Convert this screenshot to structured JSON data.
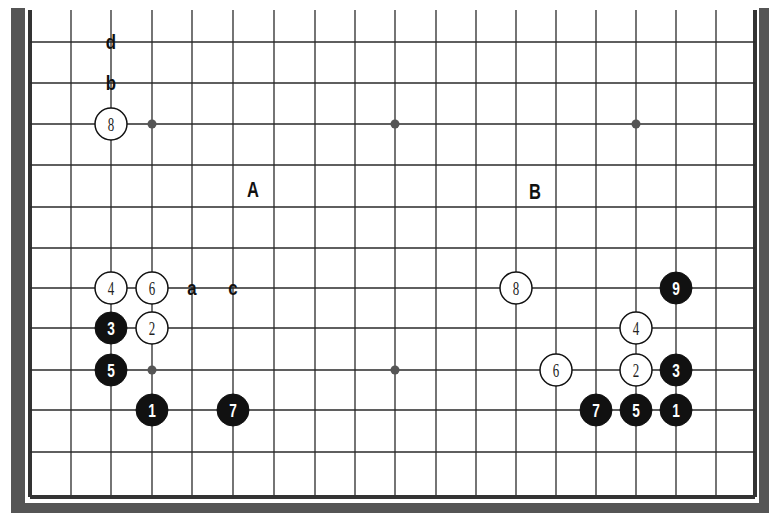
{
  "diagram": {
    "colors": {
      "border_band": "#555555",
      "grid_line": "#2a2a2a",
      "edge_line": "#333333",
      "hoshi": "#555555",
      "black_stone": "#111111",
      "white_stone": "#ffffff",
      "stone_outline": "#111111",
      "background": "#ffffff"
    },
    "grid": {
      "columns_x": [
        30,
        71,
        111,
        152,
        192,
        233,
        274,
        315,
        355,
        395,
        436,
        476,
        516,
        556,
        596,
        636,
        676,
        716,
        755
      ],
      "rows_y": [
        42,
        83,
        124,
        165,
        207,
        248,
        288,
        328,
        370,
        410,
        452,
        497
      ],
      "top_visible_y": 10
    },
    "hoshi": [
      {
        "col": 3,
        "row": 2
      },
      {
        "col": 9,
        "row": 2
      },
      {
        "col": 15,
        "row": 2
      },
      {
        "col": 3,
        "row": 8
      },
      {
        "col": 9,
        "row": 8
      },
      {
        "col": 15,
        "row": 8
      }
    ],
    "stones": [
      {
        "color": "white",
        "label": "8",
        "col": 2,
        "row": 2
      },
      {
        "color": "white",
        "label": "4",
        "col": 2,
        "row": 6
      },
      {
        "color": "white",
        "label": "6",
        "col": 3,
        "row": 6
      },
      {
        "color": "black",
        "label": "3",
        "col": 2,
        "row": 7
      },
      {
        "color": "white",
        "label": "2",
        "col": 3,
        "row": 7
      },
      {
        "color": "black",
        "label": "5",
        "col": 2,
        "row": 8
      },
      {
        "color": "black",
        "label": "1",
        "col": 3,
        "row": 9
      },
      {
        "color": "black",
        "label": "7",
        "col": 5,
        "row": 9
      },
      {
        "color": "white",
        "label": "8",
        "col": 12,
        "row": 6
      },
      {
        "color": "black",
        "label": "9",
        "col": 16,
        "row": 6
      },
      {
        "color": "white",
        "label": "4",
        "col": 15,
        "row": 7
      },
      {
        "color": "white",
        "label": "6",
        "col": 13,
        "row": 8
      },
      {
        "color": "white",
        "label": "2",
        "col": 15,
        "row": 8
      },
      {
        "color": "black",
        "label": "3",
        "col": 16,
        "row": 8
      },
      {
        "color": "black",
        "label": "7",
        "col": 14,
        "row": 9
      },
      {
        "color": "black",
        "label": "5",
        "col": 15,
        "row": 9
      },
      {
        "color": "black",
        "label": "1",
        "col": 16,
        "row": 9
      }
    ],
    "point_labels": [
      {
        "text": "d",
        "col": 2,
        "row": 0
      },
      {
        "text": "b",
        "col": 2,
        "row": 1
      },
      {
        "text": "a",
        "col": 4,
        "row": 6
      },
      {
        "text": "c",
        "col": 5,
        "row": 6
      }
    ],
    "area_labels": [
      {
        "text": "A",
        "x": 253,
        "y": 189
      },
      {
        "text": "B",
        "x": 535,
        "y": 191
      }
    ]
  }
}
